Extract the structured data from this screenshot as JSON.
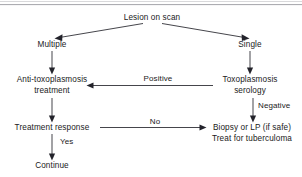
{
  "figure": {
    "type": "flowchart",
    "title_rule_present": true,
    "background_color": "#ffffff",
    "line_color": "#23232b",
    "text_color": "#1a1a1a",
    "rule_color": "#8d8d93"
  },
  "nodes": {
    "root": {
      "label": "Lesion on scan"
    },
    "multiple": {
      "label": "Multiple"
    },
    "single": {
      "label": "Single"
    },
    "anti_toxo_line1": {
      "label": "Anti-toxoplasmosis"
    },
    "anti_toxo_line2": {
      "label": "treatment"
    },
    "toxo_serology_line1": {
      "label": "Toxoplasmosis"
    },
    "toxo_serology_line2": {
      "label": "serology"
    },
    "treatment_response": {
      "label": "Treatment response"
    },
    "biopsy_line1": {
      "label": "Biopsy or LP (if safe)"
    },
    "biopsy_line2": {
      "label": "Treat for tuberculoma"
    },
    "continue": {
      "label": "Continue"
    }
  },
  "edge_labels": {
    "positive": "Positive",
    "negative": "Negative",
    "no": "No",
    "yes": "Yes"
  },
  "flow_sequence": [
    "Lesion on scan",
    "Multiple",
    "Single",
    "Anti-toxoplasmosis treatment",
    "Toxoplasmosis serology",
    "Treatment response",
    "Biopsy or LP (if safe) / Treat for tuberculoma",
    "Continue"
  ]
}
